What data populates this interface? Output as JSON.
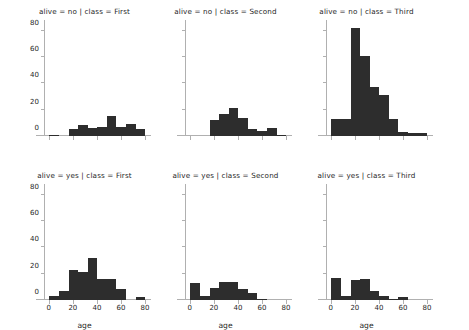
{
  "figure": {
    "kind": "facet-grid-histogram",
    "rows": 2,
    "cols": 3,
    "bar_color": "#2d2d2d",
    "axis_color": "#b0b0b0",
    "background": "#ffffff",
    "text_color": "#262626"
  },
  "axes": {
    "x_label": "age",
    "y_label": "",
    "x_ticks": [
      0,
      20,
      40,
      60,
      80
    ],
    "x_tick_labels": [
      "0",
      "20",
      "40",
      "60",
      "80"
    ],
    "y_ticks": [
      0,
      20,
      40,
      60,
      80
    ],
    "y_tick_labels": [
      "0",
      "20",
      "40",
      "60",
      "80"
    ],
    "xlim": [
      -4,
      85
    ],
    "ylim": [
      0,
      88
    ]
  },
  "chart_data": {
    "type": "bar",
    "title": "",
    "xlabel": "age",
    "ylabel": "",
    "xlim": [
      -4,
      85
    ],
    "ylim": [
      0,
      88
    ],
    "grid": false,
    "legend": "none",
    "bin_edges": [
      0.42,
      8.4,
      16.4,
      24.4,
      32.4,
      40.3,
      48.3,
      56.3,
      64.3,
      72.2,
      80.2
    ],
    "bin_centers": [
      4.4,
      12.4,
      20.4,
      28.4,
      36.4,
      44.3,
      52.3,
      60.3,
      68.3,
      76.2
    ],
    "panels": [
      {
        "id": "no-first",
        "title": "alive = no | class = First",
        "row": 0,
        "col": 0,
        "facet_alive": "no",
        "facet_class": "First",
        "values": [
          1,
          0,
          5,
          8,
          6,
          7,
          15,
          7,
          9,
          5
        ]
      },
      {
        "id": "no-second",
        "title": "alive = no | class = Second",
        "row": 0,
        "col": 1,
        "facet_alive": "no",
        "facet_class": "Second",
        "values": [
          0,
          0,
          12,
          17,
          21,
          14,
          5,
          4,
          6,
          1
        ]
      },
      {
        "id": "no-third",
        "title": "alive = no | class = Third",
        "row": 0,
        "col": 2,
        "facet_alive": "no",
        "facet_class": "Third",
        "values": [
          13,
          13,
          82,
          61,
          37,
          31,
          13,
          3,
          2,
          2
        ]
      },
      {
        "id": "yes-first",
        "title": "alive = yes | class = First",
        "row": 1,
        "col": 0,
        "facet_alive": "yes",
        "facet_class": "First",
        "values": [
          3,
          7,
          23,
          21,
          32,
          16,
          16,
          8,
          0,
          2
        ]
      },
      {
        "id": "yes-second",
        "title": "alive = yes | class = Second",
        "row": 1,
        "col": 1,
        "facet_alive": "yes",
        "facet_class": "Second",
        "values": [
          13,
          3,
          9,
          14,
          14,
          8,
          5,
          1,
          0,
          0
        ]
      },
      {
        "id": "yes-third",
        "title": "alive = yes | class = Third",
        "row": 1,
        "col": 2,
        "facet_alive": "yes",
        "facet_class": "Third",
        "values": [
          17,
          3,
          15,
          16,
          7,
          3,
          1,
          2,
          0,
          0
        ]
      }
    ]
  }
}
